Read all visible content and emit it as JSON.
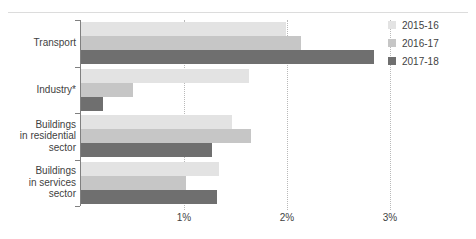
{
  "chart_data": {
    "type": "bar",
    "orientation": "horizontal",
    "title": "",
    "subtitle": "",
    "xlabel": "",
    "ylabel": "",
    "xlim": [
      0,
      3
    ],
    "x_tick_labels": [
      "1%",
      "2%",
      "3%"
    ],
    "x_tick_values": [
      1,
      2,
      3
    ],
    "grid": "vertical-dotted",
    "legend_position": "top-right",
    "categories": [
      "Transport",
      "Industry*",
      "Buildings in residential sector",
      "Buildings in services sector"
    ],
    "category_lines": [
      [
        "Transport"
      ],
      [
        "Industry*"
      ],
      [
        "Buildings",
        "in residential",
        "sector"
      ],
      [
        "Buildings",
        "in services",
        "sector"
      ]
    ],
    "series": [
      {
        "name": "2015-16",
        "color": "#e3e3e3",
        "values": [
          1.99,
          1.63,
          1.47,
          1.34
        ]
      },
      {
        "name": "2016-17",
        "color": "#c6c6c6",
        "values": [
          2.14,
          0.5,
          1.65,
          1.02
        ]
      },
      {
        "name": "2017-18",
        "color": "#6f6f6f",
        "values": [
          2.84,
          0.21,
          1.27,
          1.32
        ]
      }
    ]
  },
  "legend": {
    "items": [
      {
        "label": "2015-16"
      },
      {
        "label": "2016-17"
      },
      {
        "label": "2017-18"
      }
    ]
  },
  "colors": {
    "series_2015_16": "#e3e3e3",
    "series_2016_17": "#c6c6c6",
    "series_2017_18": "#6f6f6f",
    "axis": "#808080",
    "gridline": "#b9b9b9",
    "text": "#3f3f3f",
    "background": "#ffffff"
  }
}
